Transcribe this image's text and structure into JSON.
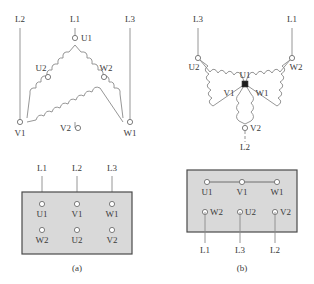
{
  "figure": {
    "captions": {
      "left": "(a)",
      "right": "(b)"
    }
  },
  "delta": {
    "name": "delta-connection-diagram",
    "supply_lines": [
      {
        "label": "L2",
        "side": "left"
      },
      {
        "label": "L1",
        "side": "top"
      },
      {
        "label": "L3",
        "side": "right"
      }
    ],
    "terminals": [
      {
        "label": "U1",
        "position": "apex"
      },
      {
        "label": "U2",
        "position": "upper-left"
      },
      {
        "label": "W2",
        "position": "upper-right"
      },
      {
        "label": "V1",
        "position": "bottom-left"
      },
      {
        "label": "V2",
        "position": "bottom-center"
      },
      {
        "label": "W1",
        "position": "bottom-right"
      }
    ]
  },
  "star": {
    "name": "star-connection-diagram",
    "supply_lines": [
      {
        "label": "L3",
        "side": "upper-left"
      },
      {
        "label": "L1",
        "side": "upper-right"
      },
      {
        "label": "L2",
        "side": "bottom"
      }
    ],
    "terminals": [
      {
        "label": "U2",
        "position": "left-outer"
      },
      {
        "label": "W2",
        "position": "right-outer"
      },
      {
        "label": "V2",
        "position": "bottom-outer"
      },
      {
        "label": "U1",
        "position": "center-top"
      },
      {
        "label": "V1",
        "position": "center-left"
      },
      {
        "label": "W1",
        "position": "center-right"
      }
    ]
  },
  "terminal_block_a": {
    "name": "terminal-block-delta",
    "top_lines": [
      "L1",
      "L2",
      "L3"
    ],
    "top_row": [
      "U1",
      "V1",
      "W1"
    ],
    "bottom_row": [
      "W2",
      "U2",
      "V2"
    ],
    "bottom_lines": [],
    "links": []
  },
  "terminal_block_b": {
    "name": "terminal-block-star",
    "top_lines": [],
    "top_row": [
      "U1",
      "V1",
      "W1"
    ],
    "bottom_row": [
      "W2",
      "U2",
      "V2"
    ],
    "bottom_lines": [
      "L1",
      "L3",
      "L2"
    ],
    "links": [
      "U1-V1",
      "V1-W1"
    ]
  },
  "colors": {
    "block_fill": "#d9d9d9",
    "block_border": "#4a4a4a",
    "wire": "#8a8a8a",
    "text": "#3a3a3a",
    "node": "#1c1c1c"
  }
}
